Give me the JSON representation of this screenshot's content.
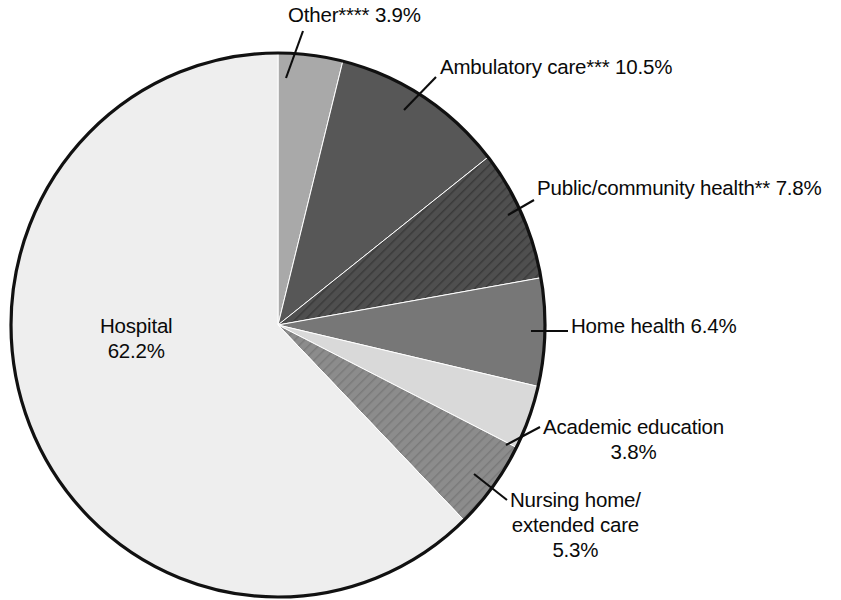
{
  "chart_data": {
    "type": "pie",
    "title": "",
    "subtitle": "",
    "xlabel": "",
    "ylabel": "",
    "legend_position": "none",
    "grid": false,
    "units": "percent",
    "start_angle_deg": 0,
    "direction": "clockwise",
    "categories": [
      "Other****",
      "Ambulatory care***",
      "Public/community health**",
      "Home health",
      "Academic education",
      "Nursing home/extended care",
      "Hospital"
    ],
    "values": [
      3.9,
      10.5,
      7.8,
      6.4,
      3.8,
      5.3,
      62.2
    ],
    "slices": [
      {
        "key": "other",
        "name": "Other****",
        "value": 3.9,
        "value_text": "3.9%",
        "label_text": "Other**** 3.9%",
        "color": "#a9a9a9",
        "pattern": "solid"
      },
      {
        "key": "ambulatory",
        "name": "Ambulatory care***",
        "value": 10.5,
        "value_text": "10.5%",
        "label_text": "Ambulatory care*** 10.5%",
        "color": "#575757",
        "pattern": "solid"
      },
      {
        "key": "public",
        "name": "Public/community health**",
        "value": 7.8,
        "value_text": "7.8%",
        "label_text": "Public/community health** 7.8%",
        "color": "#4f4f4f",
        "pattern": "diagonal-hatch"
      },
      {
        "key": "home_health",
        "name": "Home health",
        "value": 6.4,
        "value_text": "6.4%",
        "label_text": "Home health 6.4%",
        "color": "#777777",
        "pattern": "solid"
      },
      {
        "key": "academic",
        "name": "Academic education",
        "value": 3.8,
        "value_text": "3.8%",
        "label_line1": "Academic education",
        "label_line2": "3.8%",
        "color": "#d9d9d9",
        "pattern": "solid"
      },
      {
        "key": "nursing",
        "name": "Nursing home/ extended care",
        "value": 5.3,
        "value_text": "5.3%",
        "label_line1": "Nursing home/",
        "label_line2": "extended care",
        "label_line3": "5.3%",
        "color": "#8c8c8c",
        "pattern": "diagonal-hatch"
      },
      {
        "key": "hospital",
        "name": "Hospital",
        "value": 62.2,
        "value_text": "62.2%",
        "label_line1": "Hospital",
        "label_line2": "62.2%",
        "color": "#eeeeee",
        "pattern": "solid"
      }
    ]
  },
  "labels": {
    "other": "Other**** 3.9%",
    "ambulatory": "Ambulatory care*** 10.5%",
    "public": "Public/community health** 7.8%",
    "home_health": "Home health 6.4%",
    "academic_line1": "Academic education",
    "academic_line2": "3.8%",
    "nursing_line1": "Nursing home/",
    "nursing_line2": "extended care",
    "nursing_line3": "5.3%",
    "hospital_line1": "Hospital",
    "hospital_line2": "62.2%"
  },
  "style": {
    "background": "#ffffff",
    "outline": "#111111",
    "text": "#0a0a0a"
  }
}
